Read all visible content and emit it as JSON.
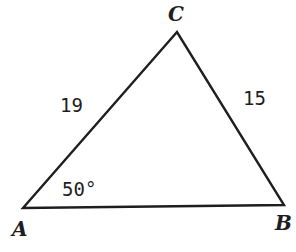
{
  "diagram": {
    "type": "triangle",
    "vertices": {
      "A": {
        "label": "A",
        "x": 23,
        "y": 208
      },
      "B": {
        "label": "B",
        "x": 284,
        "y": 205
      },
      "C": {
        "label": "C",
        "x": 177,
        "y": 32
      }
    },
    "sides": {
      "AC": {
        "label": "19"
      },
      "BC": {
        "label": "15"
      }
    },
    "angles": {
      "A": {
        "label": "50°"
      }
    },
    "colors": {
      "stroke": "#1e1e1e",
      "background": "#ffffff"
    }
  }
}
